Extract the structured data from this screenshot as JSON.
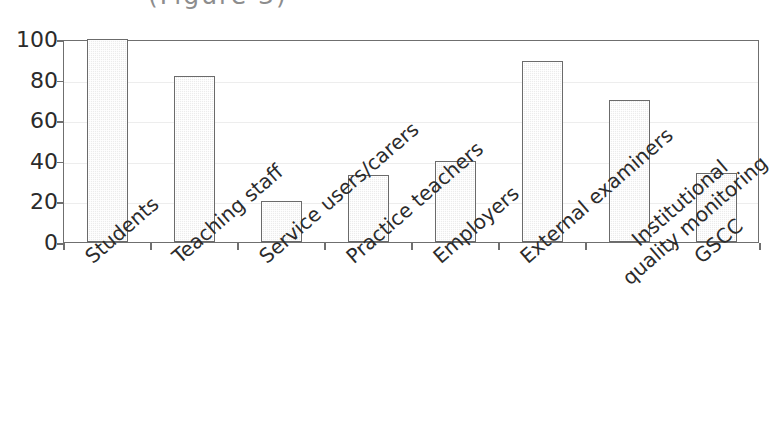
{
  "title_fragment": "(Figure 3)",
  "chart_data": {
    "type": "bar",
    "title": "",
    "xlabel": "",
    "ylabel": "",
    "categories": [
      "Students",
      "Teaching staff",
      "Service users/carers",
      "Practice teachers",
      "Employers",
      "External examiners",
      "Institutional\nquality monitoring",
      "GSCC"
    ],
    "values": [
      100,
      82,
      20,
      33,
      40,
      89,
      70,
      34
    ],
    "ylim": [
      0,
      100
    ],
    "yticks": [
      0,
      20,
      40,
      60,
      80,
      100
    ],
    "ytick_labels": [
      "0",
      "20",
      "40",
      "60",
      "80",
      "100"
    ],
    "grid": true,
    "legend": false,
    "bar_fill": "#ececec",
    "bar_edge": "#6b6b6b",
    "axis_color": "#6f6f6f",
    "grid_color": "#ededed",
    "text_color": "#2b2b2b"
  }
}
